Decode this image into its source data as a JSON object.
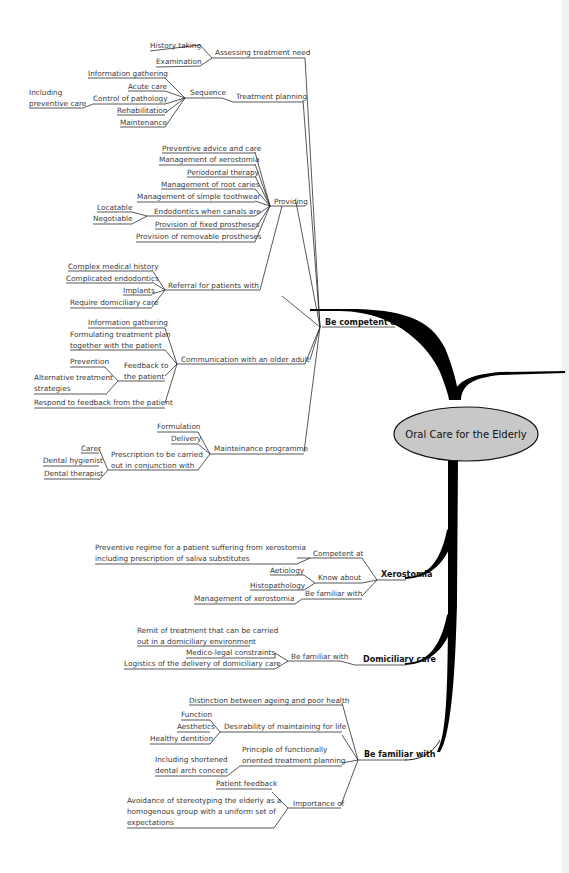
{
  "central": "Oral Care for the Elderly",
  "colors": {
    "ellipse_fill": "#c8c8c8",
    "branch": "#000000",
    "text": "#3a3a3a"
  },
  "branches": {
    "competent": {
      "label": "Be competent at",
      "assessing": {
        "label": "Assessing treatment need",
        "items": [
          "History taking",
          "Examination"
        ]
      },
      "planning": {
        "label": "Treatment planning",
        "sequence": {
          "label": "Sequence",
          "items": [
            "Information gathering",
            "Acute care",
            "Control of pathology",
            "Rehabilitation",
            "Maintenance"
          ],
          "control_note": "Including preventive care"
        }
      },
      "providing": {
        "label": "Providing",
        "items": [
          "Preventive advice and care",
          "Management of xerostomia",
          "Periodontal therapy",
          "Management of root caries",
          "Management of simple toothwear",
          "Endodontics when canals are",
          "Provision of fixed prostheses",
          "Provision of removable prostheses"
        ],
        "endo_sub": [
          "Locatable",
          "Negotiable"
        ]
      },
      "referral": {
        "label": "Referral for patients with",
        "items": [
          "Complex medical history",
          "Complicated endodontics",
          "Implants",
          "Require domiciliary care"
        ]
      },
      "communication": {
        "label": "Communication with an older adult",
        "info": "Information gathering",
        "plan_1": "Formulating treatment plan",
        "plan_2": "together with the patient",
        "feedback_1": "Feedback to",
        "feedback_2": "the patient",
        "feedback_items": [
          "Prevention",
          "Alternative treatment",
          "strategies"
        ],
        "respond": "Respond to feedback from the patient"
      },
      "maintenance": {
        "label": "Mainteinance programme",
        "items": [
          "Formulation",
          "Delivery"
        ],
        "prescription_1": "Prescription to be carried",
        "prescription_2": "out in conjunction with",
        "prescription_items": [
          "Carer",
          "Dental hygienist",
          "Dental therapist"
        ]
      }
    },
    "xerostomia": {
      "label": "Xerostomia",
      "competent": "Competent at",
      "competent_item_1": "Preventive regime for a patient suffering from xerostomia",
      "competent_item_2": "including prescription of saliva substitutes",
      "know": "Know about",
      "know_items": [
        "Aetiology",
        "Histopathology"
      ],
      "familiar": "Be familiar with",
      "familiar_item": "Management of xerostomia"
    },
    "domiciliary": {
      "label": "Domiciliary care",
      "familiar": "Be familiar with",
      "items_remit_1": "Remit of treatment that can be carried",
      "items_remit_2": "out in a domiciliary environment",
      "items": [
        "Medico-legal constraints",
        "Logistics of the delivery of domiciliary care"
      ]
    },
    "familiar": {
      "label": "Be familiar with",
      "distinction": "Distinction between ageing and poor health",
      "desirability": "Desirability of maintaining for life",
      "desirability_items": [
        "Function",
        "Aesthetics",
        "Healthy dentition"
      ],
      "principle_1": "Principle of functionally",
      "principle_2": "oriented treatment planning",
      "principle_note_1": "Including shortened",
      "principle_note_2": "dental arch concept",
      "importance": "Importance of",
      "importance_items": [
        "Patient feedback"
      ],
      "avoid_1": "Avoidance of stereotyping the elderly as a",
      "avoid_2": "homogenous group with a uniform set of",
      "avoid_3": "expectations"
    }
  }
}
